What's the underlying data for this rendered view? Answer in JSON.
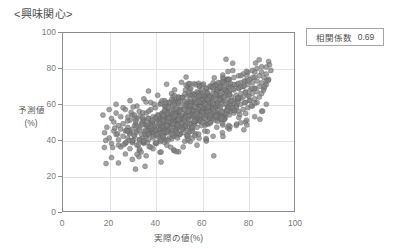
{
  "chart_title": "<興味関心>",
  "annotation": {
    "label": "相関係数",
    "value": "0.69"
  },
  "axes": {
    "x": {
      "title": "実際の値(%)",
      "ticks": [
        "0",
        "20",
        "40",
        "60",
        "80",
        "100"
      ],
      "min": 0,
      "max": 100
    },
    "y": {
      "title_line1": "予測値",
      "title_line2": "(%)",
      "ticks": [
        "0",
        "20",
        "40",
        "60",
        "80",
        "100"
      ],
      "min": 0,
      "max": 100
    }
  },
  "colors": {
    "marker_fill": "#7f7f7f",
    "marker_stroke": "#595959",
    "gridline": "#e3e3e3",
    "frame": "#8c8c8c",
    "text": "#595959"
  },
  "chart_data": {
    "type": "scatter",
    "title": "<興味関心>",
    "xlabel": "実際の値(%)",
    "ylabel": "予測値 (%)",
    "xlim": [
      0,
      100
    ],
    "ylim": [
      0,
      100
    ],
    "grid": true,
    "legend": "none",
    "correlation": 0.69,
    "n_points": 820,
    "marker": "circle",
    "marker_size": 5,
    "annotations": [
      "相関係数 0.69"
    ],
    "series": [
      {
        "name": "予測値 vs 実際の値",
        "x_mean": 56,
        "y_mean": 55,
        "x_sd": 15,
        "y_sd": 11,
        "x_range": [
          17,
          90
        ],
        "y_range": [
          21,
          87
        ],
        "points": [
          [
            18,
            44
          ],
          [
            19,
            47
          ],
          [
            20,
            41
          ],
          [
            21,
            52
          ],
          [
            21,
            38
          ],
          [
            22,
            45
          ],
          [
            22,
            50
          ],
          [
            23,
            43
          ],
          [
            23,
            55
          ],
          [
            24,
            40
          ],
          [
            24,
            48
          ],
          [
            25,
            36
          ],
          [
            25,
            46
          ],
          [
            25,
            53
          ],
          [
            26,
            42
          ],
          [
            26,
            49
          ],
          [
            27,
            38
          ],
          [
            27,
            45
          ],
          [
            27,
            57
          ],
          [
            28,
            41
          ],
          [
            28,
            47
          ],
          [
            29,
            35
          ],
          [
            29,
            44
          ],
          [
            29,
            51
          ],
          [
            30,
            39
          ],
          [
            30,
            46
          ],
          [
            30,
            54
          ],
          [
            31,
            42
          ],
          [
            31,
            48
          ],
          [
            32,
            37
          ],
          [
            32,
            45
          ],
          [
            32,
            52
          ],
          [
            33,
            40
          ],
          [
            33,
            47
          ],
          [
            33,
            56
          ],
          [
            34,
            43
          ],
          [
            34,
            49
          ],
          [
            35,
            38
          ],
          [
            35,
            45
          ],
          [
            35,
            51
          ],
          [
            36,
            42
          ],
          [
            36,
            48
          ],
          [
            36,
            55
          ],
          [
            37,
            40
          ],
          [
            37,
            46
          ],
          [
            37,
            52
          ],
          [
            38,
            36
          ],
          [
            38,
            44
          ],
          [
            38,
            50
          ],
          [
            38,
            57
          ],
          [
            39,
            41
          ],
          [
            39,
            47
          ],
          [
            39,
            53
          ],
          [
            40,
            38
          ],
          [
            40,
            45
          ],
          [
            40,
            51
          ],
          [
            40,
            58
          ],
          [
            41,
            42
          ],
          [
            41,
            48
          ],
          [
            41,
            54
          ],
          [
            42,
            39
          ],
          [
            42,
            46
          ],
          [
            42,
            52
          ],
          [
            42,
            60
          ],
          [
            43,
            43
          ],
          [
            43,
            49
          ],
          [
            43,
            55
          ],
          [
            44,
            40
          ],
          [
            44,
            47
          ],
          [
            44,
            53
          ],
          [
            44,
            59
          ],
          [
            45,
            44
          ],
          [
            45,
            50
          ],
          [
            45,
            56
          ],
          [
            46,
            41
          ],
          [
            46,
            48
          ],
          [
            46,
            54
          ],
          [
            46,
            61
          ],
          [
            47,
            45
          ],
          [
            47,
            51
          ],
          [
            47,
            57
          ],
          [
            48,
            42
          ],
          [
            48,
            49
          ],
          [
            48,
            55
          ],
          [
            48,
            62
          ],
          [
            49,
            46
          ],
          [
            49,
            52
          ],
          [
            49,
            58
          ],
          [
            50,
            43
          ],
          [
            50,
            50
          ],
          [
            50,
            56
          ],
          [
            50,
            63
          ],
          [
            51,
            47
          ],
          [
            51,
            53
          ],
          [
            51,
            59
          ],
          [
            52,
            44
          ],
          [
            52,
            51
          ],
          [
            52,
            57
          ],
          [
            52,
            64
          ],
          [
            53,
            48
          ],
          [
            53,
            54
          ],
          [
            53,
            60
          ],
          [
            54,
            45
          ],
          [
            54,
            52
          ],
          [
            54,
            58
          ],
          [
            54,
            65
          ],
          [
            55,
            49
          ],
          [
            55,
            55
          ],
          [
            55,
            61
          ],
          [
            56,
            46
          ],
          [
            56,
            53
          ],
          [
            56,
            59
          ],
          [
            56,
            66
          ],
          [
            57,
            50
          ],
          [
            57,
            56
          ],
          [
            57,
            62
          ],
          [
            58,
            47
          ],
          [
            58,
            54
          ],
          [
            58,
            60
          ],
          [
            58,
            67
          ],
          [
            59,
            51
          ],
          [
            59,
            57
          ],
          [
            59,
            63
          ],
          [
            60,
            48
          ],
          [
            60,
            55
          ],
          [
            60,
            61
          ],
          [
            60,
            68
          ],
          [
            61,
            52
          ],
          [
            61,
            58
          ],
          [
            61,
            64
          ],
          [
            62,
            49
          ],
          [
            62,
            56
          ],
          [
            62,
            62
          ],
          [
            62,
            69
          ],
          [
            63,
            53
          ],
          [
            63,
            59
          ],
          [
            63,
            65
          ],
          [
            64,
            50
          ],
          [
            64,
            57
          ],
          [
            64,
            63
          ],
          [
            64,
            70
          ],
          [
            65,
            54
          ],
          [
            65,
            60
          ],
          [
            65,
            66
          ],
          [
            66,
            51
          ],
          [
            66,
            58
          ],
          [
            66,
            64
          ],
          [
            66,
            71
          ],
          [
            67,
            55
          ],
          [
            67,
            61
          ],
          [
            67,
            67
          ],
          [
            68,
            52
          ],
          [
            68,
            59
          ],
          [
            68,
            65
          ],
          [
            68,
            72
          ],
          [
            69,
            56
          ],
          [
            69,
            62
          ],
          [
            69,
            68
          ],
          [
            70,
            53
          ],
          [
            70,
            60
          ],
          [
            70,
            66
          ],
          [
            70,
            73
          ],
          [
            71,
            57
          ],
          [
            71,
            63
          ],
          [
            71,
            69
          ],
          [
            72,
            54
          ],
          [
            72,
            61
          ],
          [
            72,
            67
          ],
          [
            72,
            74
          ],
          [
            73,
            58
          ],
          [
            73,
            64
          ],
          [
            73,
            70
          ],
          [
            74,
            55
          ],
          [
            74,
            62
          ],
          [
            74,
            68
          ],
          [
            74,
            75
          ],
          [
            75,
            59
          ],
          [
            75,
            65
          ],
          [
            75,
            71
          ],
          [
            76,
            56
          ],
          [
            76,
            63
          ],
          [
            76,
            69
          ],
          [
            76,
            76
          ],
          [
            77,
            60
          ],
          [
            77,
            66
          ],
          [
            77,
            72
          ],
          [
            78,
            57
          ],
          [
            78,
            64
          ],
          [
            78,
            70
          ],
          [
            78,
            77
          ],
          [
            79,
            61
          ],
          [
            79,
            67
          ],
          [
            79,
            73
          ],
          [
            80,
            58
          ],
          [
            80,
            65
          ],
          [
            80,
            71
          ],
          [
            80,
            78
          ],
          [
            81,
            62
          ],
          [
            81,
            68
          ],
          [
            81,
            74
          ],
          [
            82,
            59
          ],
          [
            82,
            66
          ],
          [
            82,
            72
          ],
          [
            82,
            79
          ],
          [
            83,
            63
          ],
          [
            83,
            69
          ],
          [
            83,
            75
          ],
          [
            84,
            61
          ],
          [
            84,
            67
          ],
          [
            84,
            73
          ],
          [
            84,
            80
          ],
          [
            85,
            64
          ],
          [
            85,
            70
          ],
          [
            85,
            76
          ],
          [
            86,
            66
          ],
          [
            86,
            72
          ],
          [
            86,
            78
          ],
          [
            87,
            69
          ],
          [
            87,
            75
          ],
          [
            88,
            71
          ],
          [
            88,
            77
          ],
          [
            89,
            74
          ],
          [
            90,
            79
          ],
          [
            21,
            30
          ],
          [
            24,
            27
          ],
          [
            27,
            32
          ],
          [
            30,
            29
          ],
          [
            33,
            34
          ],
          [
            36,
            31
          ],
          [
            39,
            35
          ],
          [
            42,
            33
          ],
          [
            45,
            37
          ],
          [
            48,
            34
          ],
          [
            52,
            36
          ],
          [
            55,
            39
          ],
          [
            58,
            37
          ],
          [
            62,
            40
          ],
          [
            65,
            42
          ],
          [
            69,
            44
          ],
          [
            72,
            46
          ],
          [
            75,
            48
          ],
          [
            79,
            50
          ],
          [
            83,
            53
          ],
          [
            86,
            56
          ],
          [
            88,
            60
          ],
          [
            20,
            57
          ],
          [
            23,
            60
          ],
          [
            26,
            58
          ],
          [
            29,
            62
          ],
          [
            32,
            59
          ],
          [
            35,
            63
          ],
          [
            38,
            61
          ],
          [
            41,
            65
          ],
          [
            44,
            62
          ],
          [
            47,
            66
          ],
          [
            50,
            64
          ],
          [
            53,
            68
          ],
          [
            56,
            65
          ],
          [
            59,
            70
          ],
          [
            62,
            67
          ],
          [
            65,
            72
          ],
          [
            68,
            69
          ],
          [
            71,
            74
          ],
          [
            74,
            71
          ],
          [
            77,
            76
          ],
          [
            80,
            73
          ],
          [
            83,
            78
          ],
          [
            86,
            81
          ],
          [
            89,
            84
          ]
        ]
      }
    ]
  }
}
